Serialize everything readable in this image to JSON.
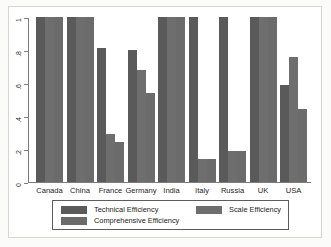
{
  "chart_data": {
    "type": "bar",
    "title": "",
    "xlabel": "",
    "ylabel": "",
    "ylim": [
      0,
      1
    ],
    "yticks": [
      "0",
      ".2",
      ".4",
      ".6",
      ".8",
      "1"
    ],
    "ytick_values": [
      0,
      0.2,
      0.4,
      0.6,
      0.8,
      1
    ],
    "grid": false,
    "legend_position": "bottom",
    "categories": [
      "Canada",
      "China",
      "France",
      "Germany",
      "India",
      "Italy",
      "Russia",
      "UK",
      "USA"
    ],
    "series": [
      {
        "name": "Technical Efficiency",
        "color": "#5a5a5a",
        "values": [
          1,
          1,
          0.81,
          0.8,
          1,
          1,
          1,
          1,
          0.59
        ]
      },
      {
        "name": "Scale Efficiency",
        "color": "#6e6e6e",
        "values": [
          1,
          1,
          0.29,
          0.68,
          1,
          0.14,
          0.19,
          1,
          0.76
        ]
      },
      {
        "name": "Comprehensive Efficiency",
        "color": "#6b6b6b",
        "values": [
          1,
          1,
          0.24,
          0.54,
          1,
          0.14,
          0.19,
          1,
          0.44
        ]
      }
    ]
  },
  "legend": {
    "entries": [
      {
        "label": "Technical Efficiency"
      },
      {
        "label": "Scale Efficiency"
      },
      {
        "label": "Comprehensive Efficiency"
      }
    ]
  }
}
